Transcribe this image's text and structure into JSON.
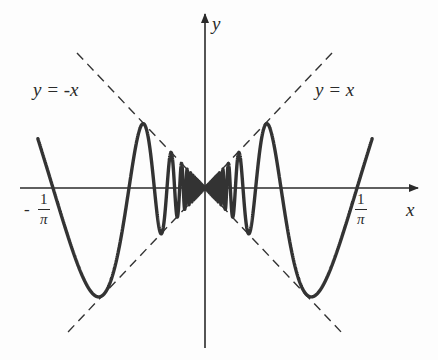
{
  "chart_data": {
    "type": "line",
    "title": "",
    "function": "y = x sin(1/x)",
    "xlabel": "x",
    "ylabel": "y",
    "x_tick_labels": [
      {
        "value": "-1/pi",
        "sign": "-",
        "numerator": "1",
        "denominator": "π"
      },
      {
        "value": "1/pi",
        "sign": "",
        "numerator": "1",
        "denominator": "π"
      }
    ],
    "xlim": [
      -0.35,
      0.35
    ],
    "series": [
      {
        "name": "x sin(1/x)",
        "style": "solid",
        "color": "#333333"
      },
      {
        "name": "y = x",
        "label": "y = x",
        "style": "dashed",
        "color": "#333333"
      },
      {
        "name": "y = -x",
        "label": "y = -x",
        "style": "dashed",
        "color": "#333333"
      }
    ],
    "annotations": [
      "y = -x",
      "y = x"
    ],
    "grid": false,
    "legend": "none"
  },
  "labels": {
    "y_axis": "y",
    "x_axis": "x",
    "line_neg": "y = -x",
    "line_pos": "y = x",
    "tick_neg_sign": "-",
    "tick_num": "1",
    "tick_den": "π"
  },
  "colors": {
    "curve": "#333333",
    "axes": "#2a2a2a",
    "background": "#fdfdfd"
  }
}
